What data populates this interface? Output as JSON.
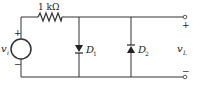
{
  "diagram": {
    "type": "circuit",
    "resistor": {
      "label": "1 kΩ"
    },
    "source": {
      "label_main": "v",
      "label_sub": "i",
      "plus": "+",
      "minus": "−"
    },
    "diodes": [
      {
        "label_main": "D",
        "label_sub": "1",
        "orientation": "down"
      },
      {
        "label_main": "D",
        "label_sub": "2",
        "orientation": "up"
      }
    ],
    "output": {
      "label_main": "v",
      "label_sub": "L",
      "plus": "+",
      "minus": "−"
    },
    "colors": {
      "wire": "#333333",
      "background": "#ffffff"
    }
  }
}
